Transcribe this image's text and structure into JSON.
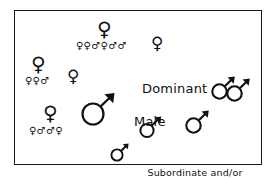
{
  "figure": {
    "border_color": "#1a1a1a",
    "background_color": "#ffffff",
    "symbol_color": "#111111"
  },
  "labels": {
    "dominant_line1": "Dominant",
    "dominant_line2": "Male",
    "subordinate_line1": "Subordinate and/or",
    "subordinate_line2": "Satellite Males"
  },
  "female_groups": [
    {
      "id": "group-top",
      "leader_symbol": "♀",
      "members": "♀♀♂♀♂♂",
      "member_count": 6
    },
    {
      "id": "group-left",
      "leader_symbol": "♀",
      "members": "♀♀♂",
      "member_count": 3
    },
    {
      "id": "group-lower-left",
      "leader_symbol": "♀",
      "members": "♀♂♂♀",
      "member_count": 4
    }
  ],
  "solitary_females": [
    {
      "id": "female-upper-right",
      "symbol": "♀"
    },
    {
      "id": "female-center-left",
      "symbol": "♀"
    }
  ],
  "males": [
    {
      "id": "dominant-male",
      "symbol": "♂",
      "role": "dominant",
      "size": "large"
    },
    {
      "id": "subordinate-male-center",
      "symbol": "♂",
      "role": "subordinate",
      "size": "medium"
    },
    {
      "id": "subordinate-male-right-lower",
      "symbol": "♂",
      "role": "subordinate",
      "size": "medium"
    },
    {
      "id": "subordinate-male-right-mid",
      "symbol": "♂",
      "role": "subordinate",
      "size": "medium"
    },
    {
      "id": "subordinate-male-right-upper",
      "symbol": "♂",
      "role": "subordinate",
      "size": "medium"
    },
    {
      "id": "subordinate-male-legend",
      "symbol": "♂",
      "role": "legend-key",
      "size": "small"
    }
  ]
}
